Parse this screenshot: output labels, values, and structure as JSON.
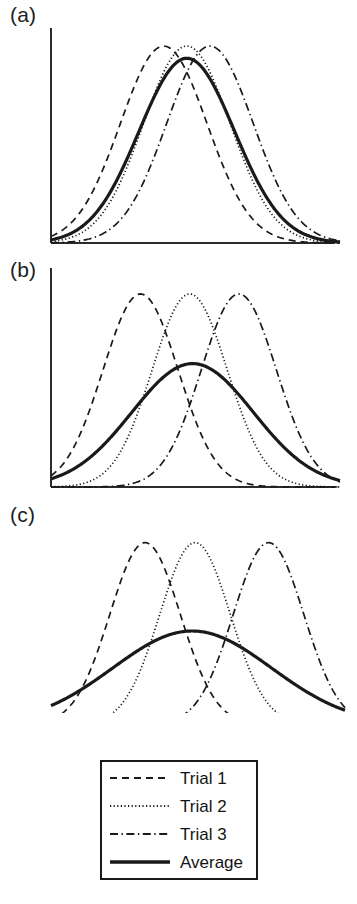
{
  "figure": {
    "panels": [
      {
        "id": "a",
        "label": "(a)"
      },
      {
        "id": "b",
        "label": "(b)"
      },
      {
        "id": "c",
        "label": "(c)"
      }
    ]
  },
  "legend": {
    "items": [
      {
        "label": "Trial 1",
        "style": "dashed",
        "swatch": "trial-1-line-swatch"
      },
      {
        "label": "Trial 2",
        "style": "dotted",
        "swatch": "trial-2-line-swatch"
      },
      {
        "label": "Trial 3",
        "style": "dashdot",
        "swatch": "trial-3-line-swatch"
      },
      {
        "label": "Average",
        "style": "solid",
        "swatch": "average-line-swatch"
      }
    ]
  },
  "colors": {
    "line": "#1a1a1a",
    "axis": "#2b2b2b",
    "background": "#ffffff"
  },
  "chart_data": [
    {
      "type": "line",
      "title": "(a)",
      "xlabel": "",
      "ylabel": "",
      "grid": false,
      "legend_position": "below-figure",
      "axis": {
        "x_line": true,
        "y_line": true,
        "ticks": false,
        "tick_labels": false
      },
      "xlim": [
        0,
        100
      ],
      "ylim": [
        0,
        1.05
      ],
      "description": "Three trial curves with closely spaced peaks; the average closely tracks the individual trials with only slightly reduced amplitude.",
      "series": [
        {
          "name": "Trial 1",
          "style": "dashed",
          "peak_x": 39,
          "peak_y": 0.97,
          "sigma": 15
        },
        {
          "name": "Trial 2",
          "style": "dotted",
          "peak_x": 47,
          "peak_y": 0.97,
          "sigma": 15
        },
        {
          "name": "Trial 3",
          "style": "dashdot",
          "peak_x": 55,
          "peak_y": 0.97,
          "sigma": 15
        },
        {
          "name": "Average",
          "style": "solid",
          "peak_x": 47,
          "peak_y": 0.91,
          "sigma": 16.5
        }
      ]
    },
    {
      "type": "line",
      "title": "(b)",
      "xlabel": "",
      "ylabel": "",
      "grid": false,
      "legend_position": "below-figure",
      "axis": {
        "x_line": true,
        "y_line": true,
        "ticks": false,
        "tick_labels": false
      },
      "xlim": [
        0,
        100
      ],
      "ylim": [
        0,
        1.05
      ],
      "description": "Trial peaks are moderately separated; the average is visibly broader and roughly 40 percent lower than the individual trial peaks.",
      "series": [
        {
          "name": "Trial 1",
          "style": "dashed",
          "peak_x": 31,
          "peak_y": 0.97,
          "sigma": 13
        },
        {
          "name": "Trial 2",
          "style": "dotted",
          "peak_x": 48,
          "peak_y": 0.97,
          "sigma": 13
        },
        {
          "name": "Trial 3",
          "style": "dashdot",
          "peak_x": 65,
          "peak_y": 0.97,
          "sigma": 13
        },
        {
          "name": "Average",
          "style": "solid",
          "peak_x": 49,
          "peak_y": 0.62,
          "sigma": 21
        }
      ]
    },
    {
      "type": "line",
      "title": "(c)",
      "xlabel": "",
      "ylabel": "",
      "grid": false,
      "legend_position": "below-figure",
      "axis": {
        "x_line": true,
        "y_line": false,
        "ticks": false,
        "tick_labels": false
      },
      "xlim": [
        0,
        100
      ],
      "ylim": [
        0,
        1.05
      ],
      "description": "Trial peaks are widely separated; the average is strongly flattened, broadened and skewed, peaking near half the trial amplitude.",
      "series": [
        {
          "name": "Trial 1",
          "style": "dashed",
          "peak_x": 32,
          "peak_y": 0.97,
          "sigma": 12
        },
        {
          "name": "Trial 2",
          "style": "dotted",
          "peak_x": 49,
          "peak_y": 0.97,
          "sigma": 12
        },
        {
          "name": "Trial 3",
          "style": "dashdot",
          "peak_x": 74,
          "peak_y": 0.97,
          "sigma": 12
        },
        {
          "name": "Average",
          "style": "solid",
          "peak_x": 48,
          "peak_y": 0.5,
          "sigma": 27
        }
      ]
    }
  ]
}
